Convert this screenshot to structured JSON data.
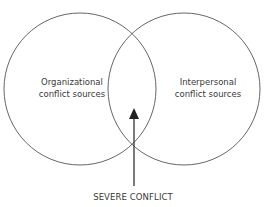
{
  "diagram": {
    "type": "venn",
    "sets": [
      {
        "id": "left",
        "label_line1": "Organizational",
        "label_line2": "conflict sources"
      },
      {
        "id": "right",
        "label_line1": "Interpersonal",
        "label_line2": "conflict sources"
      }
    ],
    "intersection": {
      "label": "SEVERE CONFLICT"
    },
    "colors": {
      "stroke": "#555555",
      "arrow": "#222222",
      "text": "#3a3a3a"
    }
  }
}
